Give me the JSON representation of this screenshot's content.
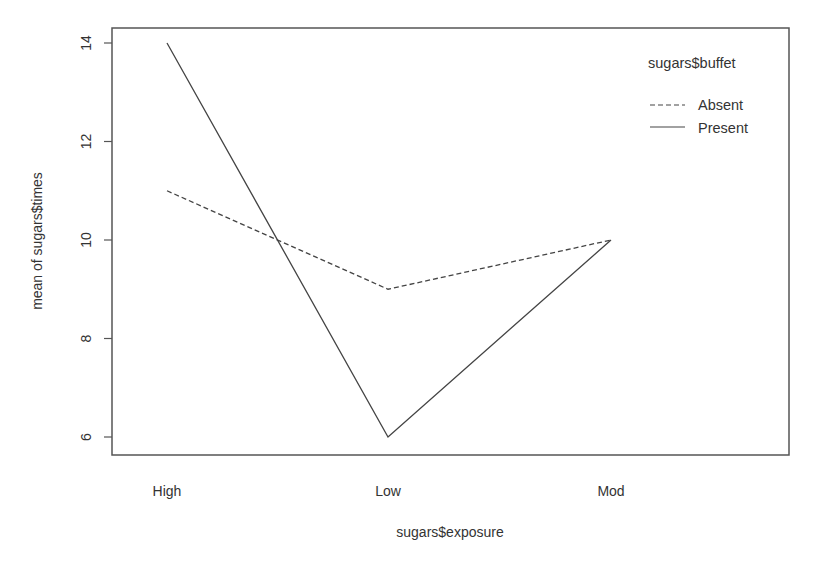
{
  "chart_data": {
    "type": "line",
    "title": "",
    "xlabel": "sugars$exposure",
    "ylabel": "mean of sugars$times",
    "categories": [
      "High",
      "Low",
      "Mod"
    ],
    "series": [
      {
        "name": "Absent",
        "values": [
          11,
          9,
          10
        ],
        "line_style": "dashed",
        "color": "#444444"
      },
      {
        "name": "Present",
        "values": [
          14,
          6,
          10
        ],
        "line_style": "solid",
        "color": "#444444"
      }
    ],
    "yticks": [
      6,
      8,
      10,
      12,
      14
    ],
    "ylim": [
      5.7,
      14.3
    ],
    "grid": false,
    "legend": {
      "title": "sugars$buffet",
      "position": "top-right",
      "entries": [
        "Absent",
        "Present"
      ]
    }
  },
  "colors": {
    "axis": "#555555",
    "line": "#444444",
    "text": "#333333",
    "background": "#ffffff"
  }
}
